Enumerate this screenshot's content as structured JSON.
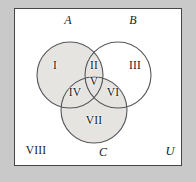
{
  "diagram": {
    "kind": "venn-diagram",
    "universe_label": "U",
    "sets": [
      {
        "id": "A",
        "label": "A",
        "shaded": true,
        "cx": 70,
        "cy": 75,
        "r": 33,
        "label_x": 68,
        "label_y": 20
      },
      {
        "id": "B",
        "label": "B",
        "shaded": false,
        "cx": 118,
        "cy": 75,
        "r": 33,
        "label_x": 133,
        "label_y": 20
      },
      {
        "id": "C",
        "label": "C",
        "shaded": true,
        "cx": 94,
        "cy": 110,
        "r": 33,
        "label_x": 103,
        "label_y": 152
      }
    ],
    "regions": [
      {
        "id": "I",
        "label": "I",
        "meaning": "A only",
        "x": 55,
        "y": 66,
        "shaded": true
      },
      {
        "id": "II",
        "label": "II",
        "meaning": "A and B only",
        "x": 94,
        "y": 66,
        "shaded": true
      },
      {
        "id": "III",
        "label": "III",
        "meaning": "B only",
        "x": 135,
        "y": 66,
        "shaded": false
      },
      {
        "id": "IV",
        "label": "IV",
        "meaning": "A and C only",
        "x": 75,
        "y": 93,
        "shaded": true
      },
      {
        "id": "V",
        "label": "V",
        "meaning": "A and B and C",
        "x": 94,
        "y": 82,
        "shaded": true
      },
      {
        "id": "VI",
        "label": "VI",
        "meaning": "B and C only",
        "x": 113,
        "y": 93,
        "shaded": true
      },
      {
        "id": "VII",
        "label": "VII",
        "meaning": "C only",
        "x": 94,
        "y": 121,
        "shaded": true
      },
      {
        "id": "VIII",
        "label": "VIII",
        "meaning": "outside A, B and C",
        "x": 36,
        "y": 151,
        "shaded": false
      }
    ],
    "universe_label_x": 170,
    "universe_label_y": 151,
    "frame": {
      "x": 14,
      "y": 8,
      "width": 168,
      "height": 158
    },
    "colors": {
      "page_margin": "#c9c9c9",
      "universe_fill": "#ffffff",
      "frame_stroke": "#44464a",
      "circle_stroke": "#55575b",
      "shade_fill": "#e6e4e1",
      "text": "#1b1b1b"
    }
  }
}
